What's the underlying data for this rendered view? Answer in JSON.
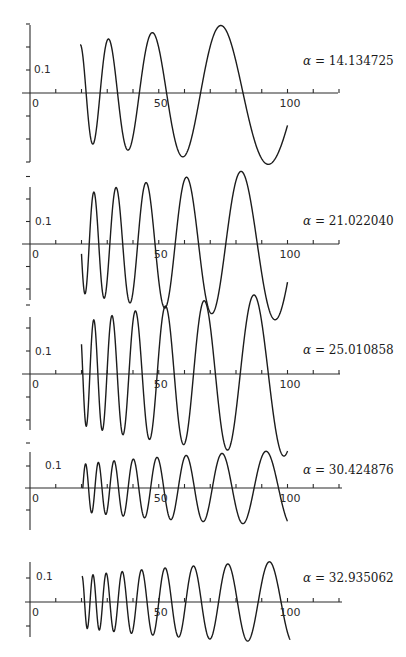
{
  "chart_data": [
    {
      "type": "line",
      "title": "",
      "annotation": "α = 14.134725",
      "alpha": 14.134725,
      "alpha_symbol": "α",
      "alpha_value": "14.134725",
      "xlabel": "",
      "ylabel": "",
      "x_ticks": [
        0,
        10,
        20,
        30,
        40,
        50,
        60,
        70,
        80,
        90,
        100,
        110,
        120
      ],
      "x_tick_labels": {
        "0": "0",
        "50": "50",
        "100": "100"
      },
      "y_tick_label": "0.1",
      "y_ticks": [
        -0.15,
        -0.1,
        -0.05,
        0,
        0.05,
        0.1,
        0.15
      ],
      "xlim": [
        0,
        127
      ],
      "ylim": [
        -0.15,
        0.15
      ],
      "grid": false,
      "series": [
        {
          "name": "curve",
          "x_start": 19.5,
          "x_end": 100,
          "phase": 1.99,
          "amp_coeff": 0.05,
          "amp_exp": 0.25
        }
      ],
      "features": {
        "zeros": [
          21.8,
          27.6,
          34.2,
          43.2,
          54.1,
          67.7,
          84.4
        ],
        "peaks": [
          [
            29.8,
            0.115
          ],
          [
            48.2,
            0.13
          ],
          [
            74.3,
            0.145
          ]
        ],
        "troughs": [
          [
            24.9,
            -0.11
          ],
          [
            38.5,
            -0.12
          ],
          [
            61.1,
            -0.13
          ],
          [
            94.9,
            -0.15
          ]
        ]
      },
      "layout": {
        "top": 0,
        "height": 175,
        "axis_y": 93,
        "px_per_unit_y": 460,
        "y_axis_top": 25,
        "y_axis_bottom": 162,
        "x_axis_left": 22,
        "x_axis_right": 338,
        "label_x": 303,
        "label_y": 55,
        "ylab_x": 34,
        "ylab_y": 64
      }
    },
    {
      "type": "line",
      "annotation": "α = 21.022040",
      "alpha": 21.02204,
      "alpha_symbol": "α",
      "alpha_value": "21.022040",
      "x_ticks": [
        0,
        10,
        20,
        30,
        40,
        50,
        60,
        70,
        80,
        90,
        100,
        110,
        120
      ],
      "x_tick_labels": {
        "0": "0",
        "50": "50",
        "100": "100"
      },
      "y_tick_label": "0.1",
      "y_ticks": [
        -0.1,
        -0.05,
        0,
        0.05,
        0.1,
        0.15
      ],
      "xlim": [
        0,
        127
      ],
      "ylim": [
        -0.12,
        0.15
      ],
      "grid": false,
      "series": [
        {
          "name": "curve",
          "x_start": 20.0,
          "x_end": 100,
          "phase": 1.63,
          "amp_coeff": 0.047,
          "amp_exp": 0.28
        }
      ],
      "features": {
        "zeros": [
          23.0,
          26.9,
          31.0,
          35.3,
          41.8,
          49.1,
          56.2,
          65.1,
          76.2
        ]
      },
      "layout": {
        "top": 175,
        "height": 130,
        "axis_y": 69,
        "px_per_unit_y": 450,
        "y_axis_top": 12,
        "y_axis_bottom": 125,
        "x_axis_left": 22,
        "x_axis_right": 339,
        "label_x": 303,
        "label_y": 40,
        "ylab_x": 35,
        "ylab_y": 41
      }
    },
    {
      "type": "line",
      "annotation": "α = 25.010858",
      "alpha": 25.010858,
      "alpha_symbol": "α",
      "alpha_value": "25.010858",
      "x_ticks": [
        0,
        10,
        20,
        30,
        40,
        50,
        60,
        70,
        80,
        90,
        100,
        110,
        120
      ],
      "x_tick_labels": {
        "0": "0",
        "50": "50",
        "100": "100"
      },
      "y_tick_label": "0.1",
      "y_ticks": [
        -0.15,
        -0.1,
        -0.05,
        0,
        0.05,
        0.1,
        0.15
      ],
      "xlim": [
        0,
        127
      ],
      "ylim": [
        -0.15,
        0.15
      ],
      "grid": false,
      "series": [
        {
          "name": "curve",
          "x_start": 20.0,
          "x_end": 100,
          "phase": 1.42,
          "amp_coeff": 0.045,
          "amp_exp": 0.3
        }
      ],
      "features": {
        "zeros": [
          20.5
        ]
      },
      "layout": {
        "top": 305,
        "height": 125,
        "axis_y": 69,
        "px_per_unit_y": 460,
        "y_axis_top": 12,
        "y_axis_bottom": 125,
        "x_axis_left": 22,
        "x_axis_right": 340,
        "label_x": 303,
        "label_y": 39,
        "ylab_x": 35,
        "ylab_y": 41
      }
    },
    {
      "type": "line",
      "annotation": "α = 30.424876",
      "alpha": 30.424876,
      "alpha_symbol": "α",
      "alpha_value": "30.424876",
      "x_ticks": [
        0,
        10,
        20,
        30,
        40,
        50,
        60,
        70,
        80,
        90,
        100,
        110,
        120
      ],
      "x_tick_labels": {
        "0": "0",
        "50": "50",
        "100": "100"
      },
      "y_tick_label": "0.1",
      "y_ticks": [
        -0.1,
        0,
        0.1
      ],
      "xlim": [
        0,
        127
      ],
      "ylim": [
        -0.12,
        0.14
      ],
      "grid": false,
      "series": [
        {
          "name": "curve",
          "x_start": 20.5,
          "x_end": 100,
          "phase": 0.77,
          "amp_coeff": 0.045,
          "amp_exp": 0.29
        }
      ],
      "features": {
        "zeros": [
          20.5
        ]
      },
      "layout": {
        "top": 430,
        "height": 115,
        "axis_y": 58,
        "px_per_unit_y": 220,
        "y_axis_top": 22,
        "y_axis_bottom": 100,
        "x_axis_left": 25,
        "x_axis_right": 342,
        "label_x": 303,
        "label_y": 34,
        "ylab_x": 45,
        "ylab_y": 30
      }
    },
    {
      "type": "line",
      "annotation": "α = 32.935062",
      "alpha": 32.935062,
      "alpha_symbol": "α",
      "alpha_value": "32.935062",
      "x_ticks": [
        0,
        10,
        20,
        30,
        40,
        50,
        60,
        70,
        80,
        90,
        100,
        110,
        120
      ],
      "x_tick_labels": {
        "0": "0",
        "50": "50",
        "100": "100"
      },
      "y_tick_label": "0.1",
      "y_ticks": [
        -0.1,
        0,
        0.1
      ],
      "xlim": [
        0,
        127
      ],
      "ylim": [
        -0.12,
        0.14
      ],
      "grid": false,
      "series": [
        {
          "name": "curve",
          "x_start": 20.2,
          "x_end": 101,
          "phase": 1.53,
          "amp_coeff": 0.045,
          "amp_exp": 0.29
        }
      ],
      "features": {
        "zeros": []
      },
      "layout": {
        "top": 545,
        "height": 112,
        "axis_y": 57,
        "px_per_unit_y": 240,
        "y_axis_top": 17,
        "y_axis_bottom": 92,
        "x_axis_left": 25,
        "x_axis_right": 342,
        "label_x": 303,
        "label_y": 27,
        "ylab_x": 36,
        "ylab_y": 26
      }
    }
  ],
  "figure": {
    "x_origin_px": 30,
    "px_per_unit_x": 2.575,
    "tick_len": 4,
    "colors": {
      "ink": "#1c1c1c",
      "axis": "#2b2b2b",
      "background": "#ffffff"
    }
  }
}
